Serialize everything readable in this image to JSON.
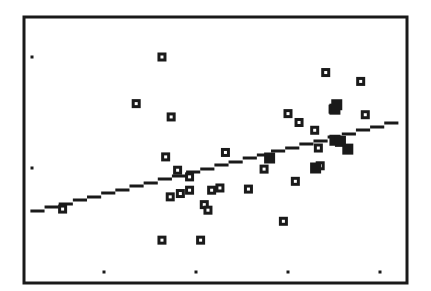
{
  "chart_data": {
    "type": "scatter",
    "title": "",
    "xlabel": "",
    "ylabel": "",
    "grid": false,
    "legend": null,
    "xlim": [
      0.12,
      4.29
    ],
    "ylim": [
      -0.04,
      2.36
    ],
    "x_ticks": [
      1,
      2,
      3,
      4
    ],
    "y_ticks": [
      1,
      2
    ],
    "tick_labels_shown": false,
    "colors": {
      "frame": "#1a1a1a",
      "marker": "#1a1a1a",
      "line": "#1a1a1a",
      "background": "#ffffff"
    },
    "series": [
      {
        "name": "data",
        "marker": "hollow-square",
        "points": [
          [
            0.55,
            0.63
          ],
          [
            1.63,
            2.0
          ],
          [
            1.35,
            1.58
          ],
          [
            1.73,
            1.46
          ],
          [
            1.67,
            1.1
          ],
          [
            1.8,
            0.98
          ],
          [
            1.93,
            0.92
          ],
          [
            1.93,
            0.8
          ],
          [
            1.83,
            0.77
          ],
          [
            1.72,
            0.74
          ],
          [
            2.17,
            0.8
          ],
          [
            2.26,
            0.82
          ],
          [
            2.09,
            0.67
          ],
          [
            2.13,
            0.62
          ],
          [
            1.63,
            0.35
          ],
          [
            2.05,
            0.35
          ],
          [
            2.32,
            1.14
          ],
          [
            2.57,
            0.81
          ],
          [
            2.74,
            0.99
          ],
          [
            2.8,
            1.09
          ],
          [
            3.08,
            0.88
          ],
          [
            2.95,
            0.52
          ],
          [
            3.0,
            1.49
          ],
          [
            3.12,
            1.41
          ],
          [
            3.29,
            1.34
          ],
          [
            3.33,
            1.18
          ],
          [
            3.35,
            1.02
          ],
          [
            3.41,
            1.86
          ],
          [
            3.79,
            1.78
          ],
          [
            3.84,
            1.48
          ],
          [
            3.49,
            1.53
          ],
          [
            3.51,
            1.25
          ],
          [
            3.57,
            1.24
          ],
          [
            3.65,
            1.17
          ]
        ],
        "filled_points": [
          [
            2.8,
            1.09
          ],
          [
            3.3,
            1.0
          ],
          [
            3.51,
            1.53
          ],
          [
            3.53,
            1.57
          ],
          [
            3.51,
            1.25
          ],
          [
            3.57,
            1.24
          ],
          [
            3.65,
            1.17
          ]
        ]
      }
    ],
    "regression_line": {
      "x": [
        0.2,
        4.2
      ],
      "y": [
        0.6,
        1.42
      ]
    }
  }
}
